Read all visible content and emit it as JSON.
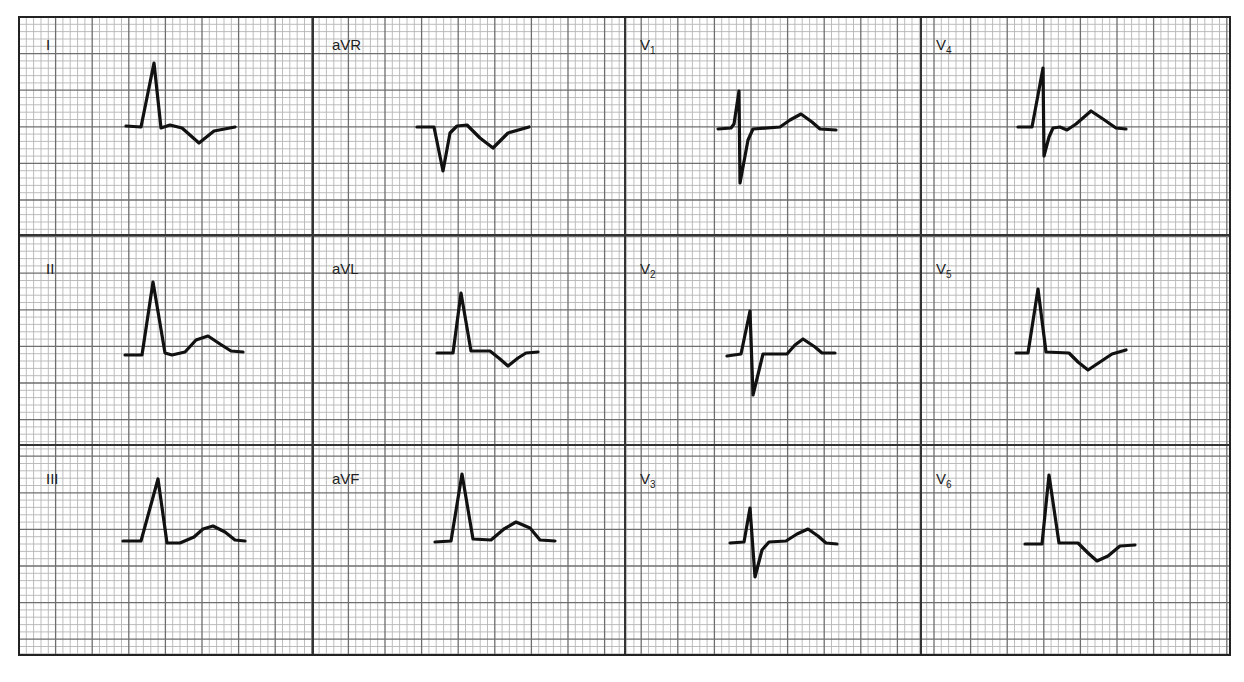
{
  "ecg": {
    "title": "12-lead ECG",
    "grid": {
      "left": 19,
      "top": 17,
      "right": 1230,
      "bottom": 655,
      "small_px": 7.32,
      "major_every": 5,
      "small_color": "#b5b5b5",
      "major_color": "#6e6e6e",
      "border_color": "#222222",
      "divider_color": "#333333",
      "column_dividers": [
        313,
        625,
        921
      ],
      "row_dividers": [
        235,
        445
      ]
    },
    "leads": [
      {
        "id": "I",
        "label": "I",
        "sub": "",
        "lx": 46,
        "ly": 38,
        "points": [
          [
            126,
            126
          ],
          [
            141,
            127
          ],
          [
            154,
            63
          ],
          [
            161,
            128
          ],
          [
            170,
            125
          ],
          [
            182,
            128
          ],
          [
            199,
            143
          ],
          [
            214,
            131
          ],
          [
            235,
            127
          ]
        ]
      },
      {
        "id": "aVR",
        "label": "aVR",
        "sub": "",
        "lx": 332,
        "ly": 38,
        "points": [
          [
            417,
            127
          ],
          [
            434,
            127
          ],
          [
            443,
            171
          ],
          [
            450,
            133
          ],
          [
            457,
            126
          ],
          [
            467,
            125
          ],
          [
            480,
            138
          ],
          [
            493,
            148
          ],
          [
            508,
            133
          ],
          [
            529,
            127
          ]
        ]
      },
      {
        "id": "V1",
        "label": "V",
        "sub": "1",
        "lx": 640,
        "ly": 38,
        "points": [
          [
            718,
            129
          ],
          [
            731,
            128
          ],
          [
            734,
            124
          ],
          [
            739,
            91
          ],
          [
            740,
            183
          ],
          [
            748,
            140
          ],
          [
            753,
            129
          ],
          [
            780,
            127
          ],
          [
            790,
            120
          ],
          [
            801,
            114
          ],
          [
            812,
            122
          ],
          [
            820,
            129
          ],
          [
            836,
            130
          ]
        ]
      },
      {
        "id": "V4",
        "label": "V",
        "sub": "4",
        "lx": 936,
        "ly": 38,
        "points": [
          [
            1018,
            127
          ],
          [
            1032,
            127
          ],
          [
            1038,
            95
          ],
          [
            1043,
            68
          ],
          [
            1044,
            156
          ],
          [
            1049,
            137
          ],
          [
            1053,
            128
          ],
          [
            1060,
            127
          ],
          [
            1067,
            130
          ],
          [
            1076,
            124
          ],
          [
            1091,
            111
          ],
          [
            1103,
            119
          ],
          [
            1116,
            128
          ],
          [
            1126,
            129
          ]
        ]
      },
      {
        "id": "II",
        "label": "II",
        "sub": "",
        "lx": 46,
        "ly": 262,
        "points": [
          [
            125,
            355
          ],
          [
            142,
            355
          ],
          [
            153,
            282
          ],
          [
            165,
            353
          ],
          [
            172,
            355
          ],
          [
            185,
            352
          ],
          [
            196,
            340
          ],
          [
            208,
            336
          ],
          [
            220,
            344
          ],
          [
            231,
            351
          ],
          [
            243,
            352
          ]
        ]
      },
      {
        "id": "aVL",
        "label": "aVL",
        "sub": "",
        "lx": 332,
        "ly": 262,
        "points": [
          [
            437,
            353
          ],
          [
            453,
            353
          ],
          [
            461,
            293
          ],
          [
            471,
            351
          ],
          [
            490,
            351
          ],
          [
            500,
            359
          ],
          [
            508,
            366
          ],
          [
            518,
            358
          ],
          [
            526,
            353
          ],
          [
            538,
            352
          ]
        ]
      },
      {
        "id": "V2",
        "label": "V",
        "sub": "2",
        "lx": 640,
        "ly": 262,
        "points": [
          [
            727,
            356
          ],
          [
            741,
            354
          ],
          [
            750,
            311
          ],
          [
            753,
            395
          ],
          [
            763,
            354
          ],
          [
            787,
            354
          ],
          [
            795,
            345
          ],
          [
            803,
            339
          ],
          [
            815,
            347
          ],
          [
            822,
            353
          ],
          [
            835,
            353
          ]
        ]
      },
      {
        "id": "V5",
        "label": "V",
        "sub": "5",
        "lx": 936,
        "ly": 262,
        "points": [
          [
            1016,
            353
          ],
          [
            1028,
            353
          ],
          [
            1038,
            289
          ],
          [
            1046,
            352
          ],
          [
            1069,
            353
          ],
          [
            1078,
            362
          ],
          [
            1088,
            370
          ],
          [
            1100,
            362
          ],
          [
            1112,
            354
          ],
          [
            1126,
            350
          ]
        ]
      },
      {
        "id": "III",
        "label": "III",
        "sub": "",
        "lx": 46,
        "ly": 472,
        "points": [
          [
            123,
            541
          ],
          [
            141,
            541
          ],
          [
            158,
            479
          ],
          [
            167,
            543
          ],
          [
            180,
            543
          ],
          [
            194,
            537
          ],
          [
            203,
            529
          ],
          [
            213,
            526
          ],
          [
            225,
            532
          ],
          [
            235,
            540
          ],
          [
            245,
            541
          ]
        ]
      },
      {
        "id": "aVF",
        "label": "aVF",
        "sub": "",
        "lx": 332,
        "ly": 472,
        "points": [
          [
            435,
            542
          ],
          [
            451,
            541
          ],
          [
            462,
            474
          ],
          [
            473,
            539
          ],
          [
            491,
            540
          ],
          [
            504,
            529
          ],
          [
            516,
            522
          ],
          [
            530,
            528
          ],
          [
            540,
            540
          ],
          [
            555,
            541
          ]
        ]
      },
      {
        "id": "V3",
        "label": "V",
        "sub": "3",
        "lx": 640,
        "ly": 472,
        "points": [
          [
            730,
            543
          ],
          [
            744,
            542
          ],
          [
            750,
            508
          ],
          [
            755,
            577
          ],
          [
            762,
            550
          ],
          [
            769,
            542
          ],
          [
            786,
            541
          ],
          [
            797,
            534
          ],
          [
            808,
            529
          ],
          [
            818,
            536
          ],
          [
            826,
            543
          ],
          [
            837,
            544
          ]
        ]
      },
      {
        "id": "V6",
        "label": "V",
        "sub": "6",
        "lx": 936,
        "ly": 472,
        "points": [
          [
            1025,
            544
          ],
          [
            1042,
            544
          ],
          [
            1049,
            475
          ],
          [
            1059,
            543
          ],
          [
            1078,
            543
          ],
          [
            1088,
            553
          ],
          [
            1097,
            561
          ],
          [
            1108,
            556
          ],
          [
            1120,
            546
          ],
          [
            1135,
            545
          ]
        ]
      }
    ]
  }
}
